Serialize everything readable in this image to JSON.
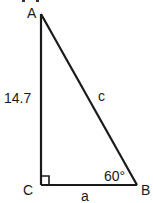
{
  "diagram": {
    "type": "right-triangle",
    "vertices": {
      "A": "A",
      "B": "B",
      "C": "C"
    },
    "sides": {
      "AC": "14.7",
      "AB": "c",
      "CB": "a"
    },
    "angles": {
      "B": "60°",
      "C_right_angle": true
    }
  }
}
